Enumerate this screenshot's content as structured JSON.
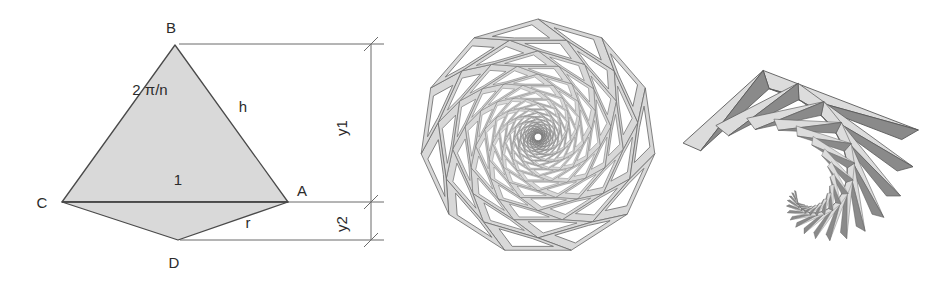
{
  "figure": {
    "background_color": "#ffffff",
    "panels": [
      {
        "id": "construction",
        "name": "polygon-angle-construction"
      },
      {
        "id": "rosette",
        "name": "eleven-fold-rosette"
      },
      {
        "id": "spiral",
        "name": "triangle-spiral"
      }
    ]
  },
  "construction": {
    "name": "polygon-angle-construction-diagram",
    "colors": {
      "fill": "#d9d9d9",
      "stroke": "#4a4a4a",
      "dimension": "#6b6b6b",
      "text": "#2b2b2b"
    },
    "points": {
      "A": {
        "label": "A",
        "x": 288,
        "y": 202
      },
      "B": {
        "label": "B",
        "x": 175,
        "y": 45
      },
      "C": {
        "label": "C",
        "x": 62,
        "y": 202
      },
      "D": {
        "label": "D",
        "x": 178,
        "y": 240
      }
    },
    "point_label_offsets": {
      "A": {
        "dx": 14,
        "dy": -6
      },
      "B": {
        "dx": -4,
        "dy": -12
      },
      "C": {
        "dx": -20,
        "dy": 6
      },
      "D": {
        "dx": -4,
        "dy": 28
      }
    },
    "edge_labels": [
      {
        "name": "apex-angle",
        "text": "2 π/n",
        "x": 150,
        "y": 95
      },
      {
        "name": "slant-height",
        "text": "h",
        "x": 243,
        "y": 112
      },
      {
        "name": "base-unit",
        "text": "1",
        "x": 178,
        "y": 185
      },
      {
        "name": "circumradius",
        "text": "r",
        "x": 248,
        "y": 228
      }
    ],
    "dimensions": [
      {
        "name": "y1",
        "text": "y1",
        "x": 347,
        "y": 128,
        "line_x": 371,
        "y_top": 44,
        "y_bottom": 202
      },
      {
        "name": "y2",
        "text": "y2",
        "x": 347,
        "y": 224,
        "line_x": 371,
        "y_top": 202,
        "y_bottom": 240
      }
    ],
    "extension_lines": [
      {
        "name": "ext-from-B",
        "x1": 179,
        "y1": 44,
        "x2": 384,
        "y2": 44
      },
      {
        "name": "ext-from-A",
        "x1": 62,
        "y1": 202,
        "x2": 384,
        "y2": 202
      },
      {
        "name": "ext-from-D",
        "x1": 180,
        "y1": 240,
        "x2": 384,
        "y2": 240
      }
    ],
    "shapes": [
      {
        "name": "main-triangle-ABC",
        "polygon": "175,45 288,202 62,202"
      },
      {
        "name": "lower-triangle-ACD",
        "polygon": "62,202 288,202 178,240"
      }
    ]
  },
  "rosette": {
    "name": "eleven-fold-nested-rosette",
    "colors": {
      "fill": "#d8d8d8",
      "stroke": "#6e6e6e"
    },
    "points_count": 11,
    "center": {
      "x": 138,
      "y": 137
    },
    "outer_radius": 118,
    "rings": 22,
    "scale_per_ring": 0.855,
    "rotation_per_ring_deg": 16.3636,
    "band_ratio": 0.62,
    "description": "Nested rotating ring of 11 quadrilateral frames shrinking toward the centre"
  },
  "spiral": {
    "name": "triangle-spiral-whirl",
    "colors": {
      "fill_light": "#dcdcdc",
      "fill_dark": "#8a8a8a",
      "stroke": "#595959"
    },
    "arms": 3,
    "steps": 17,
    "scale_per_step": 0.855,
    "rotation_per_step_deg": 15.0,
    "center": {
      "x": 128,
      "y": 196
    },
    "start_radius": 132,
    "description": "Logarithmic spiral of alternating light and dark triangles curling inward"
  }
}
